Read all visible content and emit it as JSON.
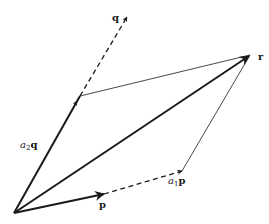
{
  "diagram": {
    "labels": {
      "q": "q",
      "r": "r",
      "p": "p",
      "a2q_coef": "a",
      "a2q_sub": "2",
      "a2q_vec": "q",
      "a1p_coef": "a",
      "a1p_sub": "1",
      "a1p_vec": "p"
    },
    "points": {
      "origin": [
        14,
        213
      ],
      "p_tip": [
        102,
        194
      ],
      "a1p": [
        182,
        171
      ],
      "a2q": [
        80,
        96
      ],
      "q_tip": [
        127,
        17
      ],
      "r": [
        250,
        55
      ]
    },
    "colors": {
      "stroke": "#1a1a1a",
      "background": "#ffffff"
    }
  }
}
